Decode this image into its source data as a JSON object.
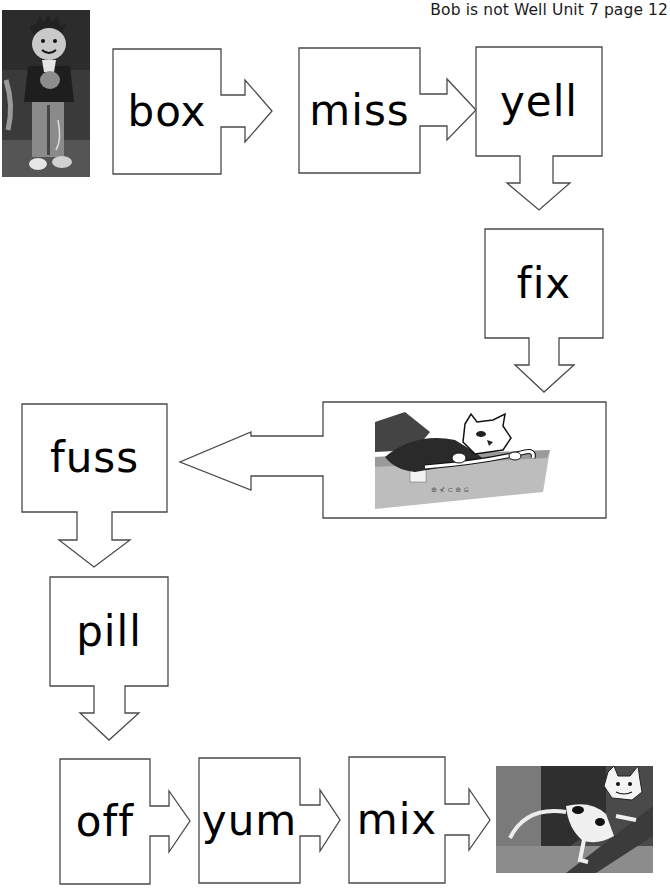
{
  "header": {
    "title": "Bob is not Well Unit 7 page 12"
  },
  "colors": {
    "outline": "#4a4a4a",
    "text": "#000000",
    "background": "#ffffff"
  },
  "flow": {
    "start_image": {
      "label": "Bob holding cat illustration",
      "icon": "boy-with-cat-picture"
    },
    "words": [
      {
        "id": "box",
        "text": "box",
        "arrow": "right"
      },
      {
        "id": "miss",
        "text": "miss",
        "arrow": "right"
      },
      {
        "id": "yell",
        "text": "yell",
        "arrow": "down"
      },
      {
        "id": "fix",
        "text": "fix",
        "arrow": "down"
      },
      {
        "id": "fuss",
        "text": "fuss",
        "arrow": "down"
      },
      {
        "id": "pill",
        "text": "pill",
        "arrow": "down"
      },
      {
        "id": "off",
        "text": "off",
        "arrow": "right"
      },
      {
        "id": "yum",
        "text": "yum",
        "arrow": "right"
      },
      {
        "id": "mix",
        "text": "mix",
        "arrow": "right"
      }
    ],
    "middle_image": {
      "label": "Cat lying in a cardboard box",
      "icon": "cat-in-box-picture",
      "arrow": "left"
    },
    "end_image": {
      "label": "Cat climbing a tree",
      "icon": "cat-in-tree-picture"
    }
  }
}
